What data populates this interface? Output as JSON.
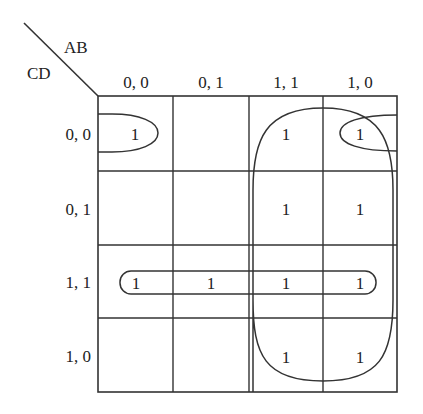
{
  "kmap": {
    "corner": {
      "top_var": "AB",
      "left_var": "CD"
    },
    "columns": [
      "0, 0",
      "0, 1",
      "1, 1",
      "1, 0"
    ],
    "rows": [
      "0, 0",
      "0, 1",
      "1, 1",
      "1, 0"
    ],
    "cells": [
      [
        "1",
        "",
        "1",
        "1"
      ],
      [
        "",
        "",
        "1",
        "1"
      ],
      [
        "1",
        "1",
        "1",
        "1"
      ],
      [
        "",
        "",
        "1",
        "1"
      ]
    ],
    "groups": [
      {
        "name": "corner-pair-row00",
        "cells": [
          [
            0,
            0
          ],
          [
            0,
            3
          ]
        ],
        "shape": "wrap-around ovals"
      },
      {
        "name": "row-11-quad",
        "cells": [
          [
            2,
            0
          ],
          [
            2,
            1
          ],
          [
            2,
            2
          ],
          [
            2,
            3
          ]
        ],
        "shape": "rounded pill"
      },
      {
        "name": "columns-11-10-octet",
        "cells": [
          [
            0,
            2
          ],
          [
            0,
            3
          ],
          [
            1,
            2
          ],
          [
            1,
            3
          ],
          [
            2,
            2
          ],
          [
            2,
            3
          ],
          [
            3,
            2
          ],
          [
            3,
            3
          ]
        ],
        "shape": "rounded rectangle"
      }
    ],
    "line_color": "#333333"
  }
}
